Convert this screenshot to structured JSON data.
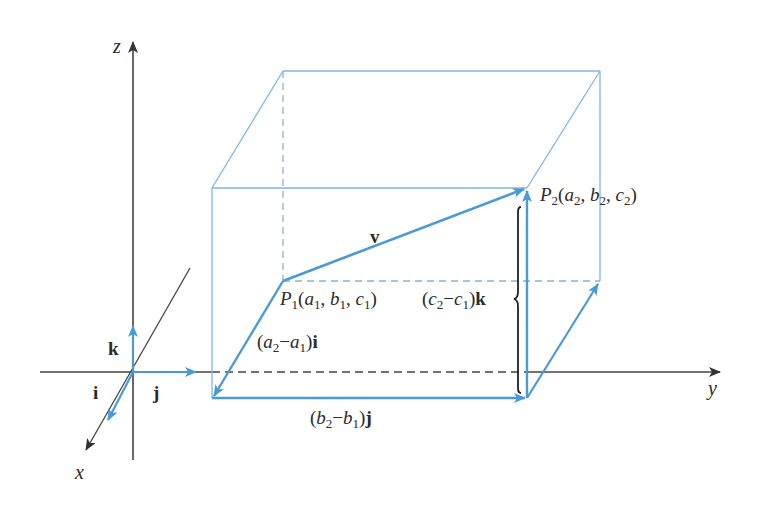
{
  "diagram": {
    "title": "",
    "axes": {
      "x": {
        "label": "x"
      },
      "y": {
        "label": "y"
      },
      "z": {
        "label": "z"
      }
    },
    "unit_vectors": {
      "i": "i",
      "j": "j",
      "k": "k"
    },
    "points": {
      "P1": {
        "name": "P",
        "sub": "1",
        "coords": [
          {
            "var": "a",
            "sub": "1"
          },
          {
            "var": "b",
            "sub": "1"
          },
          {
            "var": "c",
            "sub": "1"
          }
        ]
      },
      "P2": {
        "name": "P",
        "sub": "2",
        "coords": [
          {
            "var": "a",
            "sub": "2"
          },
          {
            "var": "b",
            "sub": "2"
          },
          {
            "var": "c",
            "sub": "2"
          }
        ]
      }
    },
    "vector": {
      "label": "v"
    },
    "components": {
      "x_component": {
        "open": "(",
        "a": "a",
        "a_sub": "2",
        "minus": "−",
        "b": "a",
        "b_sub": "1",
        "close": ")",
        "unit": "i"
      },
      "y_component": {
        "open": "(",
        "a": "b",
        "a_sub": "2",
        "minus": "−",
        "b": "b",
        "b_sub": "1",
        "close": ")",
        "unit": "j"
      },
      "z_component": {
        "open": "(",
        "a": "c",
        "a_sub": "2",
        "minus": "−",
        "b": "c",
        "b_sub": "1",
        "close": ")",
        "unit": "k"
      }
    },
    "colors": {
      "blue": "#4a9ad8",
      "blue_light": "#7fb6e2",
      "black": "#333333"
    }
  }
}
